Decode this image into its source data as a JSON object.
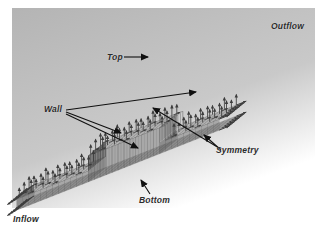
{
  "figure": {
    "background_color": "#ffffff",
    "panel_color": "#b4b4b4",
    "mesh_line_color": "#4a4a4a",
    "vector_color": "#3c3c3c",
    "leader_color": "#111111",
    "label_color": "#2a2a2a",
    "face_light": "#f2f2f2",
    "face_mid": "#a8a8a8",
    "face_dark": "#8c8c8c"
  },
  "labels": {
    "top": "Top",
    "wall": "Wall",
    "symmetry": "Symmetry",
    "bottom": "Bottom",
    "inflow": "Inflow",
    "outflow": "Outflow"
  },
  "geometry": {
    "type": "backward-facing-step-channel",
    "view": "isometric",
    "description": "Three-dimensional structured hexahedral mesh of a channel containing a step, shown in isometric projection with velocity vector glyphs at grid nodes.",
    "axis_u": {
      "dx": 5.95,
      "dy": -2.35
    },
    "axis_v": {
      "dx": -2.45,
      "dy": 2.0
    },
    "nu": 34,
    "nv": 7,
    "origin": {
      "x": 34,
      "y": 196
    },
    "step": {
      "start_u": 12,
      "end_u": 24,
      "height": 26
    },
    "slab_height": 11
  },
  "annotations": [
    {
      "name": "top",
      "label": "Top",
      "arrows": 1
    },
    {
      "name": "wall",
      "label": "Wall",
      "arrows": 3
    },
    {
      "name": "symmetry",
      "label": "Symmetry",
      "arrows": 2
    },
    {
      "name": "bottom",
      "label": "Bottom",
      "arrows": 1
    },
    {
      "name": "inflow",
      "label": "Inflow",
      "arrows": 0
    },
    {
      "name": "outflow",
      "label": "Outflow",
      "arrows": 0
    }
  ]
}
